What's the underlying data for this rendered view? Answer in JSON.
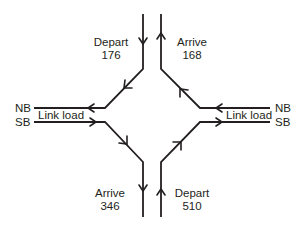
{
  "diagram": {
    "type": "interchange-flow",
    "line_color": "#231f20",
    "north": {
      "depart": {
        "label": "Depart",
        "value": "176"
      },
      "arrive": {
        "label": "Arrive",
        "value": "168"
      }
    },
    "south": {
      "arrive": {
        "label": "Arrive",
        "value": "346"
      },
      "depart": {
        "label": "Depart",
        "value": "510"
      }
    },
    "west": {
      "nb_label": "NB",
      "sb_label": "SB",
      "link_label": "Link load"
    },
    "east": {
      "nb_label": "NB",
      "sb_label": "SB",
      "link_label": "Link load"
    }
  }
}
